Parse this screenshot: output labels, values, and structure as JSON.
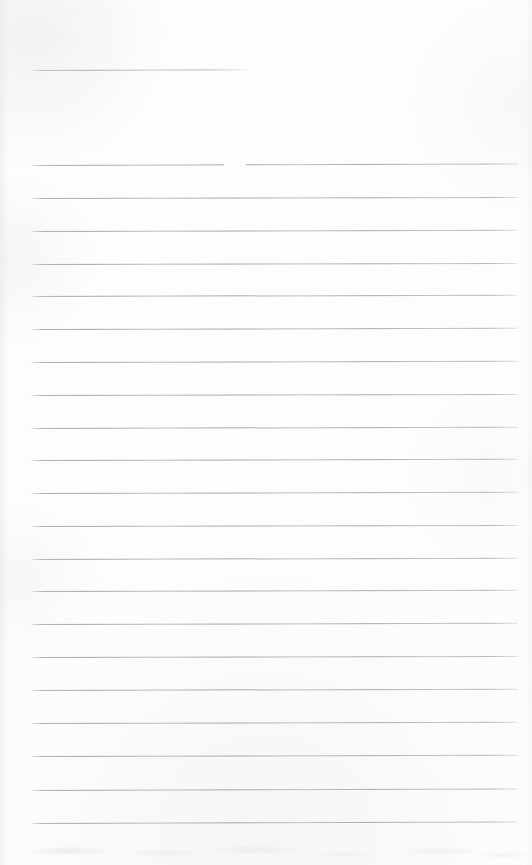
{
  "document": {
    "kind": "scanned-ruled-paper",
    "title": "Blank Lined Notebook Page",
    "content_text": "",
    "page_width": 532,
    "page_height": 865,
    "paper_color": "#fdfdfe",
    "rule_color": "#adadb5",
    "rule_thickness": 1
  },
  "header_rule": {
    "name": "short-top-rule",
    "x": 31,
    "y": 70,
    "width": 217,
    "rotate_deg": -0.18
  },
  "rule_geometry": {
    "left_x": 31,
    "right_x": 518,
    "width": 487,
    "first_y": 165,
    "spacing": 32.9,
    "count": 21
  },
  "rule_break": {
    "name": "ink-break-on-first-rule",
    "line_index": 0,
    "x": 224,
    "width": 22
  },
  "ruled_lines": [
    {
      "index": 0,
      "y": 165,
      "rotate_deg": -0.17
    },
    {
      "index": 1,
      "y": 198,
      "rotate_deg": -0.13
    },
    {
      "index": 2,
      "y": 231,
      "rotate_deg": -0.15
    },
    {
      "index": 3,
      "y": 264,
      "rotate_deg": -0.12
    },
    {
      "index": 4,
      "y": 296,
      "rotate_deg": -0.16
    },
    {
      "index": 5,
      "y": 329,
      "rotate_deg": -0.14
    },
    {
      "index": 6,
      "y": 362,
      "rotate_deg": -0.15
    },
    {
      "index": 7,
      "y": 395,
      "rotate_deg": -0.13
    },
    {
      "index": 8,
      "y": 428,
      "rotate_deg": -0.16
    },
    {
      "index": 9,
      "y": 460,
      "rotate_deg": -0.14
    },
    {
      "index": 10,
      "y": 493,
      "rotate_deg": -0.15
    },
    {
      "index": 11,
      "y": 526,
      "rotate_deg": -0.12
    },
    {
      "index": 12,
      "y": 559,
      "rotate_deg": -0.16
    },
    {
      "index": 13,
      "y": 591,
      "rotate_deg": -0.14
    },
    {
      "index": 14,
      "y": 624,
      "rotate_deg": -0.15
    },
    {
      "index": 15,
      "y": 657,
      "rotate_deg": -0.13
    },
    {
      "index": 16,
      "y": 690,
      "rotate_deg": -0.16
    },
    {
      "index": 17,
      "y": 723,
      "rotate_deg": -0.14
    },
    {
      "index": 18,
      "y": 756,
      "rotate_deg": -0.15
    },
    {
      "index": 19,
      "y": 790,
      "rotate_deg": -0.18
    },
    {
      "index": 20,
      "y": 823,
      "rotate_deg": -0.17
    }
  ]
}
